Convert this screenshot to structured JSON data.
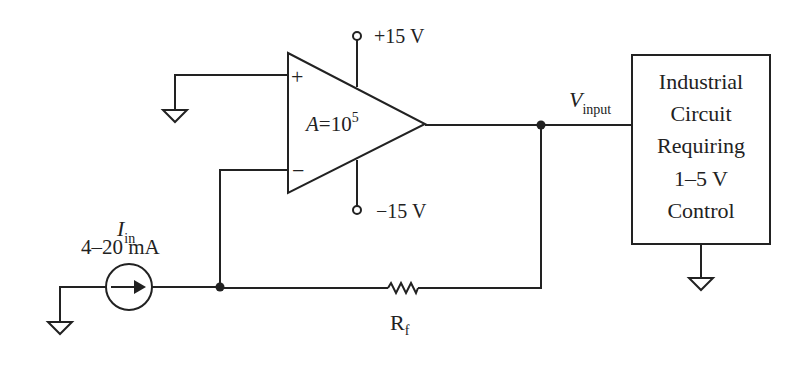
{
  "diagram": {
    "type": "circuit-schematic",
    "opamp": {
      "gain_label_var": "A",
      "gain_label_eq": "=10",
      "gain_exp": "5",
      "plus_label": "+",
      "minus_label": "−",
      "vpos_label": "+15 V",
      "vneg_label": "−15 V"
    },
    "source": {
      "label_var": "I",
      "label_sub": "in",
      "range": "4–20 mA"
    },
    "resistor": {
      "label_var": "R",
      "label_sub": "f"
    },
    "output": {
      "label_var": "V",
      "label_sub": "input"
    },
    "load_box": {
      "lines": [
        "Industrial",
        "Circuit",
        "Requiring",
        "1–5 V",
        "Control"
      ]
    }
  }
}
